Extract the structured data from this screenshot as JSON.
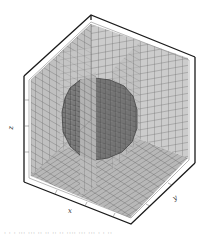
{
  "figure": {
    "type": "3d-voxel-plot",
    "axes": {
      "x_label": "x",
      "y_label": "y",
      "z_label": "z"
    },
    "colors": {
      "frame": "#1a1a1a",
      "panel_fill": "#c8c8c8",
      "panel_grid": "#555555",
      "sphere_fill": "#777777",
      "sphere_grid": "#333333",
      "background": "#ffffff"
    },
    "grid_divisions": 16
  },
  "caption": {
    "text": "· · ·  ··· ··· ·· ·· ·· ·· ···· ··· ··· · · ··"
  }
}
